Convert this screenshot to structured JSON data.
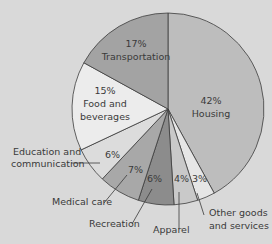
{
  "chart_data": {
    "type": "pie",
    "title": "",
    "start_angle_deg": 0,
    "direction": "clockwise",
    "categories": [
      "Housing",
      "Other goods and services",
      "Apparel",
      "Recreation",
      "Medical care",
      "Education and communication",
      "Food and beverages",
      "Transportation"
    ],
    "values": [
      42,
      3,
      4,
      6,
      7,
      6,
      15,
      17
    ],
    "unit": "%",
    "colors": [
      "#bdbdbd",
      "#e6e6e6",
      "#c9c9c9",
      "#8c8c8c",
      "#a8a8a8",
      "#dcdcdc",
      "#ececec",
      "#a3a3a3"
    ],
    "labels": [
      {
        "pct": "42%",
        "name": "Housing"
      },
      {
        "pct": "3%",
        "name": "Other goods and services"
      },
      {
        "pct": "4%",
        "name": "Apparel"
      },
      {
        "pct": "6%",
        "name": "Recreation"
      },
      {
        "pct": "7%",
        "name": "Medical care"
      },
      {
        "pct": "6%",
        "name": "Education and communication"
      },
      {
        "pct": "15%",
        "name": "Food and beverages"
      },
      {
        "pct": "17%",
        "name": "Transportation"
      }
    ]
  },
  "text": {
    "housing_pct": "42%",
    "housing": "Housing",
    "transport_pct": "17%",
    "transport": "Transportation",
    "food_pct": "15%",
    "food_1": "Food and",
    "food_2": "beverages",
    "edu_1": "Education and",
    "edu_2": "communication",
    "edu_pct": "6%",
    "med": "Medical care",
    "med_pct": "7%",
    "rec": "Recreation",
    "rec_pct": "6%",
    "app": "Apparel",
    "app_pct": "4%",
    "other_1": "Other goods",
    "other_2": "and services",
    "other_pct": "3%"
  }
}
